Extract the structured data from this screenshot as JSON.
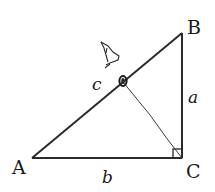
{
  "diagram": {
    "type": "right-triangle",
    "vertices": {
      "A": {
        "label": "A",
        "x": 32,
        "y": 158
      },
      "B": {
        "label": "B",
        "x": 182,
        "y": 33
      },
      "C": {
        "label": "C",
        "x": 182,
        "y": 158
      }
    },
    "sides": {
      "a": {
        "label": "a",
        "between": [
          "B",
          "C"
        ]
      },
      "b": {
        "label": "b",
        "between": [
          "A",
          "C"
        ]
      },
      "c": {
        "label": "c",
        "between": [
          "A",
          "B"
        ]
      }
    },
    "right_angle_at": "C",
    "altitude": {
      "from": "C",
      "to_point_on": "AB",
      "foot": {
        "x": 123,
        "y": 82
      }
    },
    "annotations": [
      "eye-sketch",
      "hand-drawn-point-on-hypotenuse"
    ],
    "stroke_color": "#2a2a2a"
  }
}
